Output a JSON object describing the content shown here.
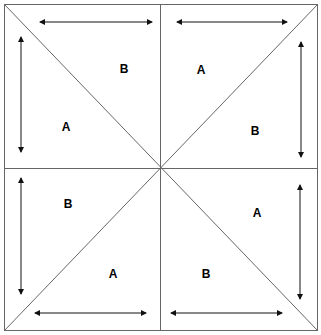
{
  "diagram": {
    "title": "",
    "stroke_color": "#555555",
    "arrow_color": "#111111",
    "labels": [
      {
        "id": "tl-b",
        "text": "B",
        "x": 124,
        "y": 73
      },
      {
        "id": "tl-a",
        "text": "A",
        "x": 66,
        "y": 131
      },
      {
        "id": "tr-a",
        "text": "A",
        "x": 201,
        "y": 74
      },
      {
        "id": "tr-b",
        "text": "B",
        "x": 255,
        "y": 135
      },
      {
        "id": "bl-b",
        "text": "B",
        "x": 68,
        "y": 208
      },
      {
        "id": "bl-a",
        "text": "A",
        "x": 113,
        "y": 278
      },
      {
        "id": "br-a",
        "text": "A",
        "x": 257,
        "y": 217
      },
      {
        "id": "br-b",
        "text": "B",
        "x": 206,
        "y": 278
      }
    ],
    "arrows": [
      {
        "id": "tl-horizontal",
        "x1": 40,
        "y1": 22,
        "x2": 152,
        "y2": 22
      },
      {
        "id": "tl-vertical",
        "x1": 21,
        "y1": 37,
        "x2": 21,
        "y2": 152
      },
      {
        "id": "tr-horizontal",
        "x1": 177,
        "y1": 22,
        "x2": 287,
        "y2": 22
      },
      {
        "id": "tr-vertical",
        "x1": 301,
        "y1": 42,
        "x2": 301,
        "y2": 157
      },
      {
        "id": "bl-vertical",
        "x1": 21,
        "y1": 178,
        "x2": 21,
        "y2": 294
      },
      {
        "id": "bl-horizontal",
        "x1": 35,
        "y1": 313,
        "x2": 146,
        "y2": 313
      },
      {
        "id": "br-vertical",
        "x1": 300,
        "y1": 185,
        "x2": 300,
        "y2": 299
      },
      {
        "id": "br-horizontal",
        "x1": 171,
        "y1": 313,
        "x2": 282,
        "y2": 313
      }
    ]
  }
}
